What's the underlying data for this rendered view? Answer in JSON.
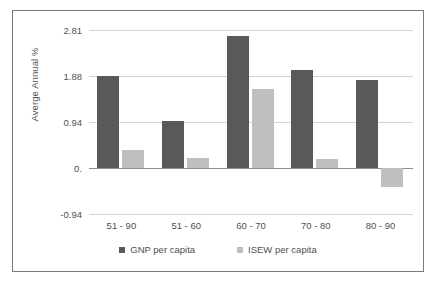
{
  "chart_data": {
    "type": "bar",
    "title": "",
    "xlabel": "",
    "ylabel": "Averge Annual %",
    "categories": [
      "51 - 90",
      "51 - 60",
      "60 - 70",
      "70 - 80",
      "80 - 90"
    ],
    "series": [
      {
        "name": "GNP per capita",
        "color": "#595959",
        "values": [
          1.88,
          0.95,
          2.68,
          1.99,
          1.8
        ]
      },
      {
        "name": "ISEW per capita",
        "color": "#bfbfbf",
        "values": [
          0.37,
          0.21,
          1.6,
          0.18,
          -0.38
        ]
      }
    ],
    "ylim": [
      -0.94,
      2.81
    ],
    "yticks": [
      "2.81",
      "1.88",
      "0.94",
      "0.",
      "-0.94"
    ],
    "ytick_values": [
      2.81,
      1.88,
      0.94,
      0,
      -0.94
    ],
    "grid": true,
    "legend_position": "bottom"
  },
  "legend": {
    "items": [
      {
        "label": "GNP per capita"
      },
      {
        "label": "ISEW per capita"
      }
    ]
  },
  "colors": {
    "series_gnp": "#595959",
    "series_isew": "#bfbfbf",
    "gridline": "#d4d4d4",
    "axis": "#8c8c8c",
    "text": "#4f4f4f",
    "frame": "#7a7a7a"
  }
}
